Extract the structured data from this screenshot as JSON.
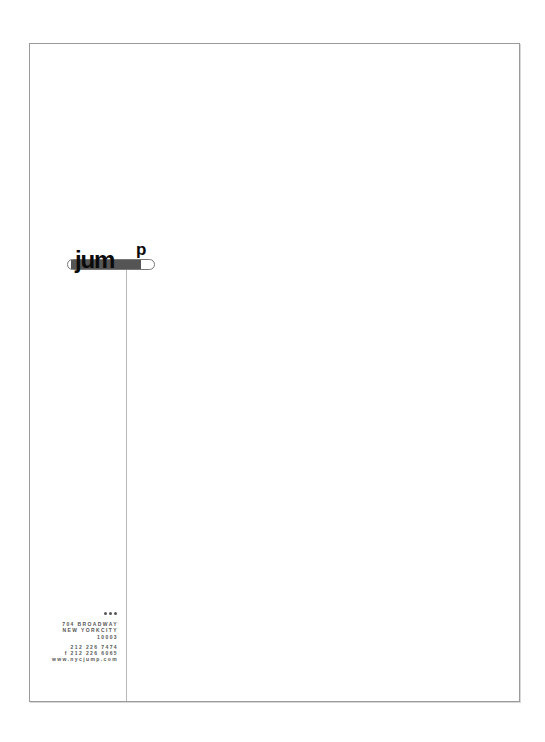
{
  "document": {
    "type": "letterhead",
    "colors": {
      "border": "#9a9a9a",
      "rule": "#b8b8b8",
      "logo_text": "#0a0a0a",
      "logo_bar": "#555555",
      "address_text": "#555555"
    }
  },
  "logo": {
    "word": "jum",
    "superscript": "p",
    "icon": "pill-bar-icon"
  },
  "contact": {
    "decoration": "three-dots-icon",
    "address": [
      "704 BROADWAY",
      "NEW YORKCITY",
      "10003"
    ],
    "phone": "212 226 7474",
    "fax": "f 212 226 6065",
    "website": "www.nycjump.com"
  }
}
